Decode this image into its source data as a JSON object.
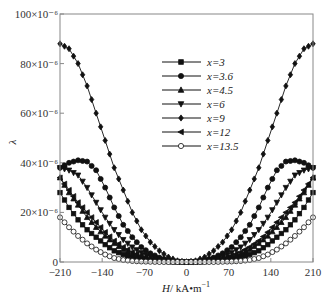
{
  "chart_data": {
    "type": "line",
    "title": "",
    "xlabel": "H/ kA•m⁻¹",
    "xlabel_parts": {
      "var": "H",
      "unit": "/ kA•m",
      "exp": "−1"
    },
    "ylabel": "λ",
    "xlim": [
      -210,
      210
    ],
    "ylim": [
      0,
      100
    ],
    "y_scale_note": "×10⁻⁶",
    "xticks": [
      -210,
      -140,
      -70,
      0,
      70,
      140,
      210
    ],
    "yticks": [
      {
        "value": 0,
        "label": "0"
      },
      {
        "value": 20,
        "label": "20×10⁻⁶"
      },
      {
        "value": 40,
        "label": "40×10⁻⁶"
      },
      {
        "value": 60,
        "label": "60×10⁻⁶"
      },
      {
        "value": 80,
        "label": "80×10⁻⁶"
      },
      {
        "value": 100,
        "label": "100×10⁻⁶"
      }
    ],
    "grid": false,
    "legend_position": "upper-center",
    "x": [
      -210,
      -195,
      -180,
      -165,
      -150,
      -135,
      -120,
      -105,
      -90,
      -75,
      -60,
      -45,
      -30,
      -15,
      0,
      15,
      30,
      45,
      60,
      75,
      90,
      105,
      120,
      135,
      150,
      165,
      180,
      195,
      210
    ],
    "series": [
      {
        "name": "x=3",
        "marker": "square",
        "filled": true,
        "values": [
          28,
          22,
          17,
          13,
          10,
          7,
          4.5,
          3,
          2,
          1.2,
          0.7,
          0.4,
          0.2,
          0.1,
          0,
          0.1,
          0.2,
          0.4,
          0.7,
          1.2,
          2,
          3,
          4.5,
          7,
          10,
          13,
          17,
          22,
          28
        ]
      },
      {
        "name": "x=3.6",
        "marker": "circle",
        "filled": true,
        "values": [
          38,
          40,
          41,
          40.5,
          37,
          30,
          22,
          15,
          10,
          6,
          3.5,
          1.8,
          0.7,
          0.2,
          0,
          0.2,
          0.7,
          1.8,
          3.5,
          6,
          10,
          15,
          22,
          30,
          37,
          40.5,
          41,
          40,
          38
        ]
      },
      {
        "name": "x=4.5",
        "marker": "triangle-up",
        "filled": true,
        "values": [
          34,
          28,
          23,
          18,
          14,
          10.5,
          7.5,
          5,
          3.2,
          2,
          1.1,
          0.5,
          0.2,
          0.1,
          0,
          0.1,
          0.2,
          0.5,
          1.1,
          2,
          3.2,
          5,
          7.5,
          10.5,
          14,
          18,
          23,
          28,
          34
        ]
      },
      {
        "name": "x=6",
        "marker": "triangle-down",
        "filled": true,
        "values": [
          38,
          37,
          35,
          30,
          24,
          18,
          13,
          9,
          6,
          3.8,
          2.2,
          1.1,
          0.4,
          0.1,
          0,
          0.1,
          0.4,
          1.1,
          2.2,
          3.8,
          6,
          9,
          13,
          18,
          24,
          30,
          35,
          37,
          38
        ]
      },
      {
        "name": "x=9",
        "marker": "diamond",
        "filled": true,
        "values": [
          88,
          86,
          80,
          71,
          60,
          49,
          38,
          29,
          20,
          13,
          8,
          4.5,
          2,
          0.5,
          0,
          0.5,
          2,
          4.5,
          8,
          13,
          20,
          29,
          38,
          49,
          60,
          71,
          80,
          86,
          88
        ]
      },
      {
        "name": "x=12",
        "marker": "triangle-left",
        "filled": true,
        "values": [
          34,
          29,
          24,
          20,
          16,
          12,
          8.5,
          6,
          4,
          2.5,
          1.4,
          0.7,
          0.3,
          0.1,
          0,
          0.1,
          0.3,
          0.7,
          1.4,
          2.5,
          4,
          6,
          8.5,
          12,
          16,
          20,
          24,
          29,
          34
        ]
      },
      {
        "name": "x=13.5",
        "marker": "circle",
        "filled": false,
        "values": [
          18,
          14,
          10.5,
          7.5,
          5,
          3,
          1.6,
          0.8,
          0.4,
          0.2,
          0.1,
          0,
          0,
          0,
          0,
          0,
          0,
          0,
          0.1,
          0.2,
          0.4,
          0.8,
          1.6,
          3,
          5,
          7.5,
          10.5,
          14,
          18
        ]
      }
    ]
  }
}
